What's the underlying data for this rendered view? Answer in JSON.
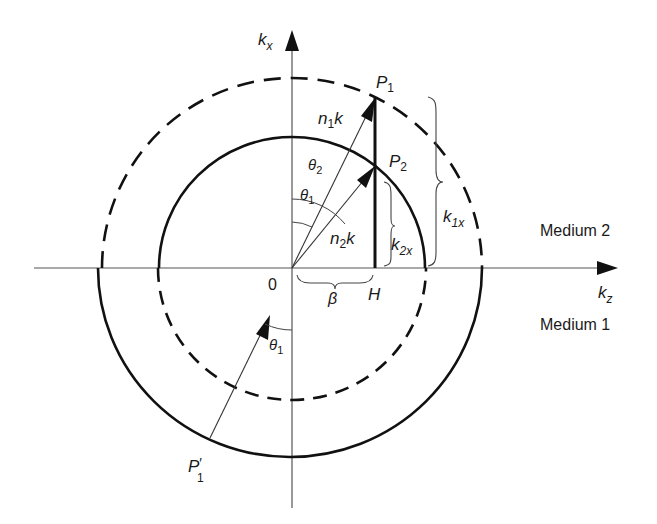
{
  "figure": {
    "axes": {
      "vertical_label": "k",
      "vertical_sub": "x",
      "horizontal_label": "k",
      "horizontal_sub": "z",
      "origin_label": "0"
    },
    "points": {
      "p1": {
        "base": "P",
        "sub": "1"
      },
      "p2": {
        "base": "P",
        "sub": "2"
      },
      "p1_prime": {
        "base": "P",
        "prime": "′",
        "sub": "1"
      },
      "h": "H"
    },
    "vectors": {
      "n1k": {
        "n": "n",
        "sub": "1",
        "k": "k"
      },
      "n2k": {
        "n": "n",
        "sub": "2",
        "k": "k"
      }
    },
    "angles": {
      "theta2": {
        "sym": "θ",
        "sub": "2"
      },
      "theta1_upper": {
        "sym": "θ",
        "sub": "1"
      },
      "theta1_lower": {
        "sym": "θ",
        "sub": "1"
      }
    },
    "braces": {
      "k1x": {
        "k": "k",
        "sub": "1x"
      },
      "k2x": {
        "k": "k",
        "sub": "2x"
      },
      "beta": "β"
    },
    "regions": {
      "upper": "Medium 2",
      "lower": "Medium 1"
    },
    "circles": {
      "outer_radius_label": "n1k",
      "inner_radius_label": "n2k",
      "upper_half": {
        "outer": "dashed",
        "inner": "solid"
      },
      "lower_half": {
        "outer": "solid",
        "inner": "dashed"
      }
    }
  }
}
